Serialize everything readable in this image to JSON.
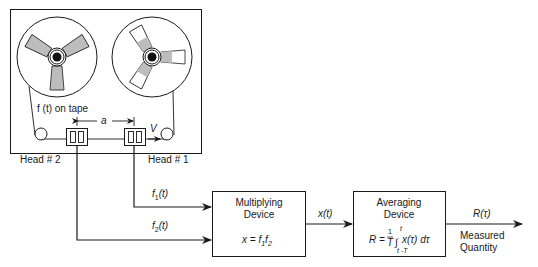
{
  "diagram": {
    "tape_label": "f (t) on tape",
    "spacing_label": "a",
    "velocity_label": "V",
    "head2_label": "Head # 2",
    "head1_label": "Head # 1",
    "signal1": {
      "base": "f",
      "sub": "1",
      "arg": "(t)"
    },
    "signal2": {
      "base": "f",
      "sub": "2",
      "arg": "(t)"
    },
    "multiplier": {
      "title_line1": "Multiplying",
      "title_line2": "Device",
      "eq_lhs": "x = f",
      "eq_sub1": "1",
      "eq_mid": "f",
      "eq_sub2": "2"
    },
    "product_label": "x(t)",
    "averager": {
      "title_line1": "Averaging",
      "title_line2": "Device",
      "eq_lhs": "R =",
      "frac_num": "1",
      "frac_den": "T",
      "int_upper": "t",
      "int_lower": "t -T",
      "integrand": "x(τ) dτ"
    },
    "output_label": "R(τ)",
    "output_desc_line1": "Measured",
    "output_desc_line2": "Quantity"
  }
}
